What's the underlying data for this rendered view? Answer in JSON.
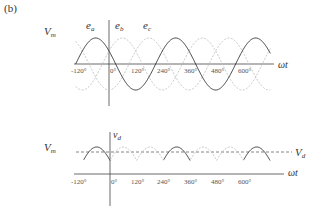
{
  "figure": {
    "panel_label": "(b)",
    "colors": {
      "solid_curve": "#3a3a3a",
      "dashed_curve": "#bdbdbd",
      "axis": "#444444",
      "vd_line": "#666666"
    }
  },
  "chart_data": [
    {
      "type": "line",
      "title": "",
      "xlabel": "ωt",
      "ylabel": "",
      "y_max_label": "V_m",
      "x_ticks": [
        "-120°",
        "0°",
        "120°",
        "240°",
        "360°",
        "480°",
        "600°"
      ],
      "x_range_deg": [
        -150,
        720
      ],
      "series": [
        {
          "name": "e_a",
          "style": "solid",
          "amplitude": 1,
          "phase_deg": 150
        },
        {
          "name": "e_b",
          "style": "dashed",
          "amplitude": 1,
          "phase_deg": 30
        },
        {
          "name": "e_c",
          "style": "dashed",
          "amplitude": 1,
          "phase_deg": -90
        }
      ],
      "grid": false
    },
    {
      "type": "line",
      "title": "",
      "xlabel": "ωt",
      "ylabel": "v_d",
      "y_max_label": "V_m",
      "reference_line_label": "V_d",
      "x_ticks": [
        "-120°",
        "0°",
        "120°",
        "240°",
        "360°",
        "480°",
        "600°"
      ],
      "description": "Rectified output: peaks of the three phase voltages (upper envelope), e_a peaks solid, others dashed; dashed average line V_d",
      "grid": false
    }
  ],
  "labels": {
    "top": {
      "vm": "V",
      "vm_sub": "m",
      "ea": "e",
      "ea_sub": "a",
      "eb": "e",
      "eb_sub": "b",
      "ec": "e",
      "ec_sub": "c",
      "xaxis": "ωt",
      "ticks": [
        "-120°",
        "0°",
        "120°",
        "240°",
        "360°",
        "480°",
        "600°"
      ]
    },
    "bottom": {
      "vm": "V",
      "vm_sub": "m",
      "vd_axis": "v",
      "vd_axis_sub": "d",
      "vd_line": "V",
      "vd_line_sub": "d",
      "xaxis": "ωt",
      "ticks": [
        "-120°",
        "0°",
        "120°",
        "240°",
        "360°",
        "480°",
        "600°"
      ]
    }
  }
}
